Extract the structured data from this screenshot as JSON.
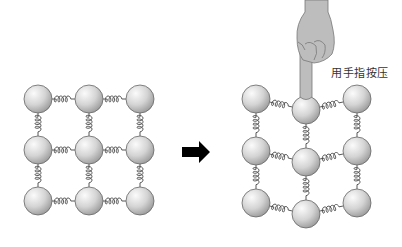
{
  "diagram": {
    "title": "",
    "label_press": "用手指按压",
    "left_panel": {
      "name": "lattice-before",
      "rows": 3,
      "cols": 3,
      "ball_radius": 14,
      "balls": [
        {
          "x": 38,
          "y": 99
        },
        {
          "x": 89,
          "y": 99
        },
        {
          "x": 140,
          "y": 99
        },
        {
          "x": 38,
          "y": 150
        },
        {
          "x": 89,
          "y": 150
        },
        {
          "x": 140,
          "y": 150
        },
        {
          "x": 38,
          "y": 201
        },
        {
          "x": 89,
          "y": 201
        },
        {
          "x": 140,
          "y": 201
        }
      ]
    },
    "arrow": {
      "direction": "right",
      "color": "#000000"
    },
    "right_panel": {
      "name": "lattice-pressed",
      "rows": 3,
      "cols": 3,
      "ball_radius": 14,
      "balls": [
        {
          "x": 256,
          "y": 99
        },
        {
          "x": 306,
          "y": 110
        },
        {
          "x": 357,
          "y": 99
        },
        {
          "x": 256,
          "y": 151
        },
        {
          "x": 306,
          "y": 162
        },
        {
          "x": 357,
          "y": 151
        },
        {
          "x": 256,
          "y": 203
        },
        {
          "x": 306,
          "y": 214
        },
        {
          "x": 357,
          "y": 203
        }
      ]
    },
    "colors": {
      "ball_light": "#f4f4f4",
      "ball_dark": "#9a9a9a",
      "outline": "#666666",
      "spring": "#444444",
      "hand": "#b8b8b8",
      "hand_outline": "#777777"
    }
  }
}
